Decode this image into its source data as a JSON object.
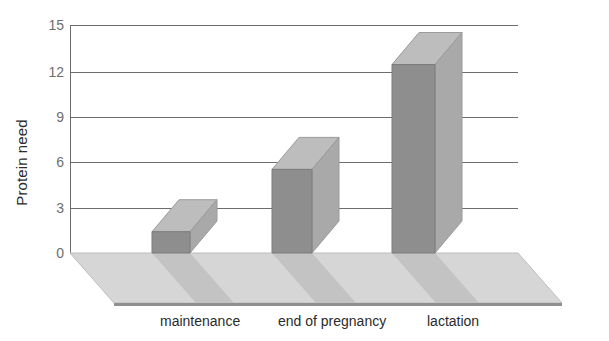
{
  "chart_data": {
    "type": "bar",
    "title": "",
    "subtitle": "",
    "xlabel": "",
    "ylabel": "Protein need",
    "categories": [
      "maintenance",
      "end of pregnancy",
      "lactation"
    ],
    "values": [
      1.4,
      5.5,
      12.4
    ],
    "ylim": [
      0,
      15
    ],
    "yticks": [
      0,
      3,
      6,
      9,
      12,
      15
    ],
    "ytick_labels": [
      "0",
      "3",
      "6",
      "9",
      "12",
      "15"
    ],
    "grid": true,
    "legend": false,
    "legend_position": "none",
    "style": "3d-bar",
    "series": [
      {
        "name": "Protein need",
        "values": [
          1.4,
          5.5,
          12.4
        ]
      }
    ]
  },
  "axis": {
    "y_title": "Protein need",
    "ticks": [
      {
        "label": "15",
        "value": 15
      },
      {
        "label": "12",
        "value": 12
      },
      {
        "label": "9",
        "value": 9
      },
      {
        "label": "6",
        "value": 6
      },
      {
        "label": "3",
        "value": 3
      },
      {
        "label": "0",
        "value": 0
      }
    ]
  },
  "x_labels": [
    {
      "label": "maintenance"
    },
    {
      "label": "end of pregnancy"
    },
    {
      "label": "lactation"
    }
  ],
  "colors": {
    "bar_front": "#8e8e8e",
    "bar_side": "#a9a9a9",
    "bar_top": "#bdbdbd",
    "floor": "#d4d4d4",
    "floor_shadow": "#c2c2c2",
    "gridline": "#6d6d6d",
    "tick_text": "#6e6e6e",
    "label_text": "#2b2b2b",
    "background": "#ffffff"
  }
}
